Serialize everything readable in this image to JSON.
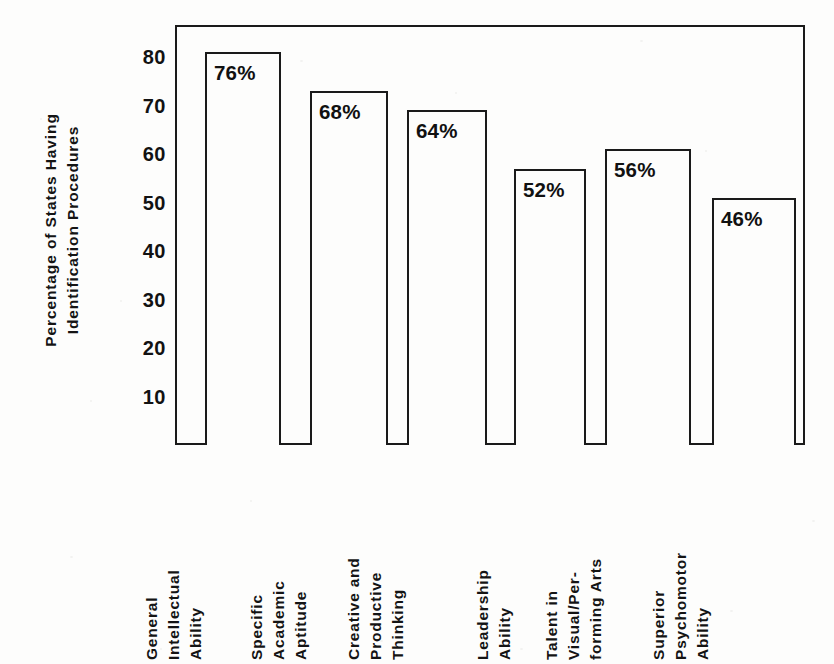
{
  "chart_data": {
    "type": "bar",
    "title": "",
    "subtitle": "",
    "xlabel": "",
    "ylabel": "Percentage of States Having Identification Procedures",
    "ylabel_lines": [
      "Percentage of States Having",
      "Identification Procedures"
    ],
    "ylim": [
      0,
      85
    ],
    "yticks": [
      80,
      70,
      60,
      50,
      40,
      30,
      20,
      10
    ],
    "ytick_labels": [
      "80",
      "70",
      "60",
      "50",
      "40",
      "30",
      "20",
      "10"
    ],
    "grid": false,
    "legend": "none",
    "categories": [
      "General Intellectual Ability",
      "Specific Academic Aptitude",
      "Creative and Productive Thinking",
      "Leadership Ability",
      "Talent in Visual/Performing Arts",
      "Superior Psychomotor Ability"
    ],
    "category_label_lines": [
      [
        "General",
        "Intellectual",
        "Ability"
      ],
      [
        "Specific",
        "Academic",
        "Aptitude"
      ],
      [
        "Creative and",
        "Productive",
        "Thinking"
      ],
      [
        "Leadership",
        "Ability"
      ],
      [
        "Talent in",
        "Visual/Per-",
        "forming Arts"
      ],
      [
        "Superior",
        "Psychomotor",
        "Ability"
      ]
    ],
    "values": [
      76,
      68,
      64,
      52,
      56,
      46
    ],
    "data_labels": [
      "76%",
      "68%",
      "64%",
      "52%",
      "56%",
      "46%"
    ],
    "bar_fill_color": "#fdfdfc",
    "bar_outline_color": "#1a1a1a",
    "axis_color": "#1a1a1a",
    "background_color": "#fdfdfc",
    "text_color": "#131313"
  }
}
